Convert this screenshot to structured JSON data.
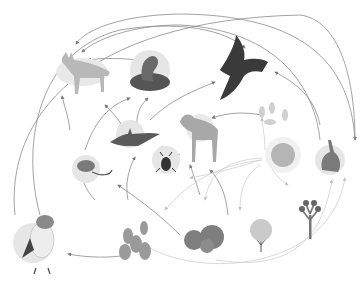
{
  "diagram": {
    "type": "food-web",
    "theme": "desert",
    "colors": {
      "background": "#ffffff",
      "arrow": "#8a8a8a",
      "circle": "#e6e6e6",
      "organism": "#6e6e6e"
    },
    "organisms": [
      {
        "id": "coyote",
        "label": "coyote"
      },
      {
        "id": "rattlesnake",
        "label": "rattlesnake"
      },
      {
        "id": "hawk",
        "label": "hawk"
      },
      {
        "id": "kangaroo-rat",
        "label": "kangaroo rat"
      },
      {
        "id": "bat",
        "label": "bat"
      },
      {
        "id": "beetle",
        "label": "beetle"
      },
      {
        "id": "bighorn-sheep",
        "label": "bighorn sheep"
      },
      {
        "id": "seeds",
        "label": "seeds"
      },
      {
        "id": "sun",
        "label": "sun"
      },
      {
        "id": "jackrabbit",
        "label": "jackrabbit"
      },
      {
        "id": "owl",
        "label": "burrowing owl"
      },
      {
        "id": "prickly-pear",
        "label": "prickly pear cactus"
      },
      {
        "id": "barrel-cactus",
        "label": "barrel cactus"
      },
      {
        "id": "shrub",
        "label": "creosote shrub"
      },
      {
        "id": "joshua-tree",
        "label": "joshua tree"
      }
    ]
  }
}
